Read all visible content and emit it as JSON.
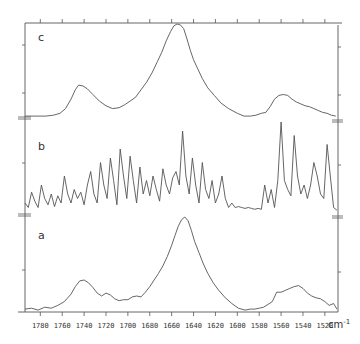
{
  "chart_data": {
    "type": "line",
    "title": "",
    "xlabel": "cm-1",
    "ylabel": "",
    "x_reversed": true,
    "xlim": [
      1794,
      1508
    ],
    "x_ticks": [
      1780,
      1760,
      1740,
      1720,
      1700,
      1680,
      1660,
      1640,
      1620,
      1600,
      1580,
      1560,
      1540,
      1520
    ],
    "x_tick_labels": [
      "1780",
      "1760",
      "1740",
      "1720",
      "1700",
      "1680",
      "1660",
      "1640",
      "1620",
      "1600",
      "1580",
      "1560",
      "1540",
      "1520"
    ],
    "unit_label": "cm",
    "unit_exponent": "-1",
    "grid": false,
    "legend": "none",
    "panels": [
      {
        "name": "c",
        "description": "Broad amide I absorbance band",
        "x": [
          1794,
          1785,
          1775,
          1768,
          1762,
          1757,
          1752,
          1748,
          1745,
          1741,
          1737,
          1732,
          1726,
          1720,
          1714,
          1708,
          1703,
          1698,
          1693,
          1688,
          1683,
          1678,
          1673,
          1669,
          1665,
          1661,
          1658,
          1655,
          1652,
          1649,
          1646,
          1643,
          1640,
          1636,
          1632,
          1627,
          1621,
          1615,
          1608,
          1600,
          1594,
          1588,
          1583,
          1578,
          1574,
          1570,
          1566,
          1562,
          1558,
          1554,
          1550,
          1546,
          1542,
          1538,
          1534,
          1530,
          1526,
          1522,
          1518,
          1514,
          1510
        ],
        "values": [
          0.02,
          0.02,
          0.02,
          0.03,
          0.05,
          0.1,
          0.2,
          0.3,
          0.35,
          0.34,
          0.31,
          0.25,
          0.18,
          0.13,
          0.1,
          0.11,
          0.14,
          0.18,
          0.22,
          0.3,
          0.38,
          0.48,
          0.6,
          0.7,
          0.82,
          0.92,
          0.98,
          1.0,
          0.99,
          0.95,
          0.84,
          0.72,
          0.62,
          0.52,
          0.42,
          0.32,
          0.24,
          0.16,
          0.1,
          0.05,
          0.02,
          0.02,
          0.03,
          0.05,
          0.06,
          0.12,
          0.2,
          0.24,
          0.25,
          0.24,
          0.2,
          0.17,
          0.15,
          0.13,
          0.12,
          0.1,
          0.08,
          0.06,
          0.05,
          0.03,
          0.02
        ]
      },
      {
        "name": "b",
        "description": "Fourier self-deconvolved spectrum showing resolved component bands",
        "x": [
          1794,
          1791,
          1788,
          1785,
          1782,
          1779,
          1776,
          1773,
          1770,
          1767,
          1764,
          1761,
          1758,
          1755,
          1752,
          1749,
          1746,
          1743,
          1740,
          1737,
          1734,
          1731,
          1728,
          1725,
          1722,
          1719,
          1716,
          1713,
          1710,
          1707,
          1704,
          1701,
          1698,
          1695,
          1692,
          1689,
          1686,
          1683,
          1680,
          1677,
          1674,
          1671,
          1668,
          1665,
          1662,
          1659,
          1656,
          1653,
          1650,
          1647,
          1644,
          1641,
          1638,
          1635,
          1632,
          1629,
          1626,
          1623,
          1620,
          1617,
          1614,
          1611,
          1608,
          1605,
          1602,
          1599,
          1596,
          1593,
          1590,
          1587,
          1584,
          1581,
          1578,
          1575,
          1572,
          1569,
          1566,
          1563,
          1560,
          1557,
          1554,
          1551,
          1548,
          1545,
          1542,
          1539,
          1536,
          1533,
          1530,
          1527,
          1524,
          1521,
          1518,
          1515,
          1512,
          1509
        ],
        "values": [
          0.1,
          0.05,
          0.22,
          0.12,
          0.05,
          0.3,
          0.15,
          0.08,
          0.2,
          0.06,
          0.18,
          0.1,
          0.4,
          0.2,
          0.1,
          0.25,
          0.15,
          0.22,
          0.08,
          0.3,
          0.45,
          0.2,
          0.1,
          0.55,
          0.3,
          0.15,
          0.6,
          0.35,
          0.08,
          0.7,
          0.4,
          0.15,
          0.62,
          0.35,
          0.1,
          0.5,
          0.2,
          0.35,
          0.18,
          0.4,
          0.25,
          0.12,
          0.48,
          0.3,
          0.2,
          0.38,
          0.45,
          0.3,
          0.9,
          0.4,
          0.2,
          0.6,
          0.3,
          0.1,
          0.55,
          0.25,
          0.15,
          0.35,
          0.1,
          0.2,
          0.4,
          0.15,
          0.05,
          0.1,
          0.05,
          0.06,
          0.05,
          0.04,
          0.05,
          0.04,
          0.03,
          0.04,
          0.03,
          0.3,
          0.1,
          0.25,
          0.05,
          0.35,
          1.0,
          0.35,
          0.25,
          0.18,
          0.85,
          0.4,
          0.2,
          0.3,
          0.15,
          0.3,
          0.55,
          0.4,
          0.2,
          0.15,
          0.75,
          0.4,
          0.05,
          0.02
        ]
      },
      {
        "name": "a",
        "description": "Original absorbance spectrum",
        "x": [
          1794,
          1788,
          1782,
          1776,
          1770,
          1764,
          1758,
          1752,
          1748,
          1744,
          1740,
          1736,
          1732,
          1728,
          1724,
          1720,
          1716,
          1712,
          1708,
          1704,
          1700,
          1696,
          1692,
          1688,
          1684,
          1680,
          1676,
          1672,
          1668,
          1664,
          1660,
          1657,
          1654,
          1651,
          1648,
          1645,
          1642,
          1639,
          1635,
          1631,
          1627,
          1622,
          1617,
          1611,
          1605,
          1599,
          1593,
          1588,
          1584,
          1580,
          1576,
          1572,
          1568,
          1564,
          1560,
          1556,
          1552,
          1548,
          1544,
          1540,
          1536,
          1532,
          1528,
          1524,
          1520,
          1516,
          1512,
          1509
        ],
        "values": [
          0.02,
          0.03,
          0.01,
          0.04,
          0.03,
          0.06,
          0.1,
          0.18,
          0.26,
          0.32,
          0.33,
          0.3,
          0.25,
          0.19,
          0.16,
          0.19,
          0.17,
          0.13,
          0.11,
          0.12,
          0.12,
          0.15,
          0.16,
          0.15,
          0.2,
          0.26,
          0.33,
          0.4,
          0.48,
          0.58,
          0.7,
          0.8,
          0.9,
          0.97,
          1.0,
          0.96,
          0.86,
          0.74,
          0.62,
          0.5,
          0.4,
          0.3,
          0.22,
          0.14,
          0.08,
          0.03,
          0.01,
          0.02,
          0.02,
          0.03,
          0.04,
          0.07,
          0.1,
          0.2,
          0.2,
          0.22,
          0.24,
          0.26,
          0.27,
          0.24,
          0.19,
          0.16,
          0.14,
          0.13,
          0.1,
          0.06,
          0.08,
          0.02
        ]
      }
    ]
  },
  "panel_labels": {
    "c": "c",
    "b": "b",
    "a": "a"
  },
  "axis": {
    "unit": "cm",
    "unit_exp": "-1",
    "ticks": [
      "1780",
      "1760",
      "1740",
      "1720",
      "1700",
      "1680",
      "1660",
      "1640",
      "1620",
      "1600",
      "1580",
      "1560",
      "1540",
      "1520"
    ]
  }
}
